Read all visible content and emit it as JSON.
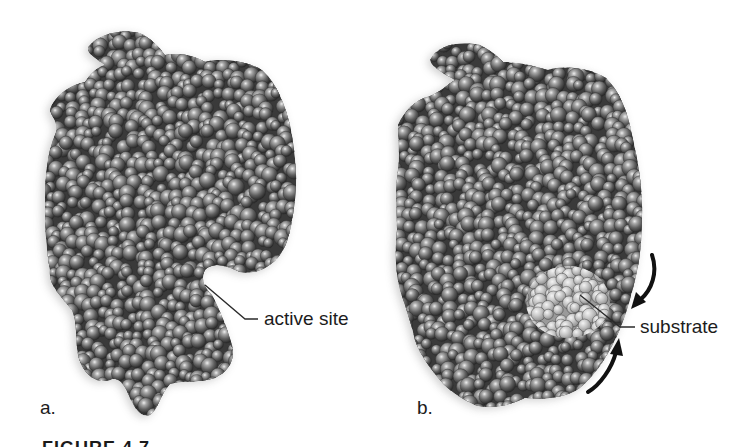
{
  "figure": {
    "panels": [
      {
        "id": "a",
        "label": "a.",
        "callout": "active site"
      },
      {
        "id": "b",
        "label": "b.",
        "callout": "substrate"
      }
    ],
    "caption": "FIGURE 4.7",
    "colors": {
      "background": "#ffffff",
      "atom_dark": "#2e2e2e",
      "atom_mid": "#6d6d6d",
      "atom_highlight": "#e6e6e6",
      "substrate_dark": "#8a8a8a",
      "substrate_light": "#e2e2e2",
      "label_text": "#1c1c1c",
      "arrow": "#111111"
    }
  }
}
